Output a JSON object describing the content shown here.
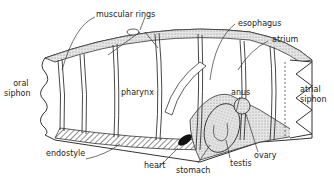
{
  "diagram": {
    "labels": {
      "muscular_rings": "muscular rings",
      "esophagus": "esophagus",
      "atrium": "atrium",
      "oral_siphon_line1": "oral",
      "oral_siphon_line2": "siphon",
      "pharynx": "pharynx",
      "anus": "anus",
      "atrial_siphon_line1": "atrial",
      "atrial_siphon_line2": "siphon",
      "endostyle": "endostyle",
      "heart": "heart",
      "stomach": "stomach",
      "testis": "testis",
      "ovary": "ovary"
    },
    "colors": {
      "line": "#333333",
      "fill": "#ffffff",
      "stipple": "#bdbdbd",
      "hatch": "#444444",
      "heart": "#111111"
    }
  }
}
